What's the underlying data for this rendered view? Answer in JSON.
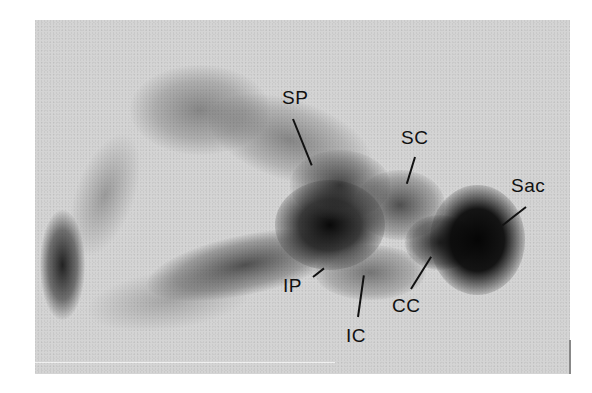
{
  "figure": {
    "background_color": "#d4d4d4",
    "ink_color": "#111111",
    "labels": [
      {
        "id": "SP",
        "text": "SP"
      },
      {
        "id": "SC",
        "text": "SC"
      },
      {
        "id": "Sac",
        "text": "Sac"
      },
      {
        "id": "IP",
        "text": "IP"
      },
      {
        "id": "IC",
        "text": "IC"
      },
      {
        "id": "CC",
        "text": "CC"
      }
    ]
  }
}
